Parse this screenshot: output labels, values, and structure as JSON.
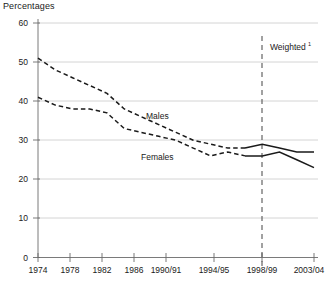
{
  "chart_data": {
    "type": "line",
    "title": "Percentages",
    "xlabel": "",
    "ylabel": "Percentages",
    "ylim": [
      0,
      60
    ],
    "yticks": [
      0,
      10,
      20,
      30,
      40,
      50,
      60
    ],
    "grid": true,
    "legend": "inline-labels",
    "categories": [
      "1974",
      "1976",
      "1978",
      "1980",
      "1982",
      "1984",
      "1986",
      "1988",
      "1990/91",
      "1992/93",
      "1994/95",
      "1996/97",
      "1998/99",
      "2000/01",
      "2001/02",
      "2002/03",
      "2003/04"
    ],
    "xtick_labels": [
      "1974",
      "1978",
      "1982",
      "1986",
      "1990/91",
      "1994/95",
      "1998/99",
      "2003/04"
    ],
    "series": [
      {
        "name": "Males",
        "label": "Males",
        "values": [
          51,
          48,
          46,
          44,
          42,
          38,
          36,
          34,
          32,
          30,
          29,
          28,
          28,
          29,
          28,
          27,
          27
        ],
        "style_before_break": "dashed",
        "style_after_break": "solid"
      },
      {
        "name": "Females",
        "label": "Females",
        "values": [
          41,
          39,
          38,
          38,
          37,
          33,
          32,
          31,
          30,
          28,
          26,
          27,
          26,
          26,
          27,
          25,
          23
        ],
        "style_before_break": "dashed",
        "style_after_break": "solid"
      }
    ],
    "annotations": [
      {
        "name": "weighted-divider",
        "label": "Weighted",
        "superscript": "1",
        "at_category": "1998/99",
        "type": "vertical-dashed-line"
      }
    ]
  },
  "labels": {
    "males": "Males",
    "females": "Females",
    "weighted": "Weighted",
    "weighted_sup": "1",
    "axis_title": "Percentages",
    "y_0": "0",
    "y_10": "10",
    "y_20": "20",
    "y_30": "30",
    "y_40": "40",
    "y_50": "50",
    "y_60": "60",
    "x_1974": "1974",
    "x_1978": "1978",
    "x_1982": "1982",
    "x_1986": "1986",
    "x_1990": "1990/91",
    "x_1994": "1994/95",
    "x_1998": "1998/99",
    "x_2003": "2003/04"
  },
  "colors": {
    "line": "#1a1a1a",
    "grid": "#c9c9c9",
    "axis": "#6b6b6b",
    "background": "#ffffff"
  }
}
